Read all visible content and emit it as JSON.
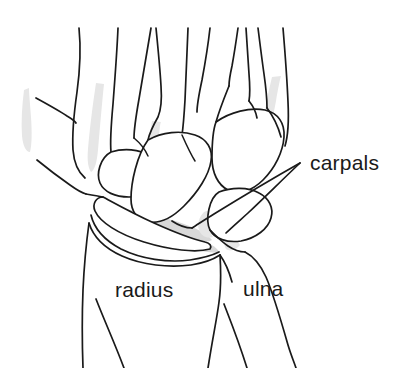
{
  "figure": {
    "type": "anatomical-line-drawing",
    "view": "dorsal",
    "background_color": "#ffffff",
    "line_color": "#1a1a1a",
    "shade_light_color": "#e6e6e6",
    "shade_mid_color": "#d8d8d8"
  },
  "labels": {
    "carpals": {
      "text": "carpals",
      "x": 310,
      "y": 163,
      "has_leader": true,
      "leader_style": "two-pronged-v"
    },
    "radius": {
      "text": "radius",
      "x": 115,
      "y": 297,
      "has_leader": false
    },
    "ulna": {
      "text": "ulna",
      "x": 243,
      "y": 296,
      "has_leader": false
    }
  },
  "structures": [
    {
      "name": "metacarpals",
      "count": 5,
      "region": "top"
    },
    {
      "name": "carpal-bone-cluster",
      "count": 6,
      "region": "middle"
    },
    {
      "name": "radius",
      "region": "lower-left"
    },
    {
      "name": "ulna",
      "region": "lower-right"
    }
  ]
}
